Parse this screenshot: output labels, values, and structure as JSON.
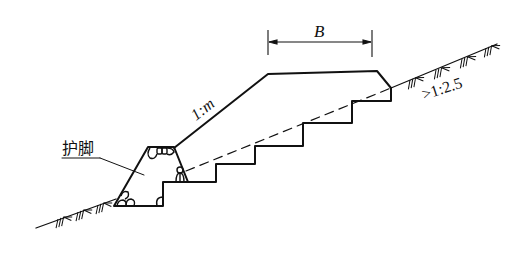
{
  "diagram": {
    "type": "embankment cross-section with toe protection and stepped foundation",
    "labels": {
      "width_dim": "B",
      "fill_slope": "1:m",
      "ground_slope": ">1:2.5",
      "toe": "护脚"
    },
    "colors": {
      "line": "#111111",
      "background": "#ffffff"
    }
  }
}
